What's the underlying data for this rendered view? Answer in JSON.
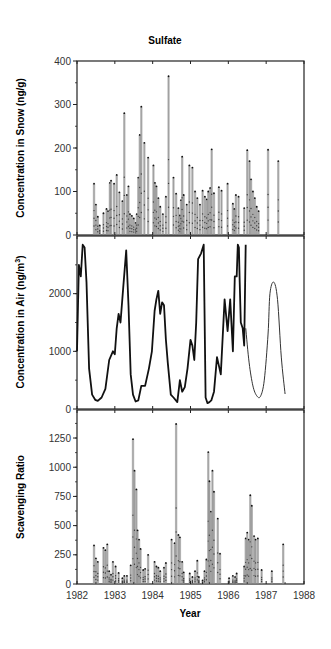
{
  "figure": {
    "title": "Sulfate",
    "xlabel": "Year",
    "x_ticks": [
      "1982",
      "1983",
      "1984",
      "1985",
      "1986",
      "1987",
      "1988"
    ],
    "colors": {
      "frame": "#222222",
      "bar": "#8a8a8a",
      "marker": "#111111",
      "line": "#111111",
      "model_line": "#333333"
    }
  },
  "chart_data": [
    {
      "type": "bar",
      "title": "Sulfate",
      "xlabel": "Year",
      "ylabel": "Concentration in Snow (ng/g)",
      "xlim": [
        1982,
        1988
      ],
      "ylim": [
        0,
        400
      ],
      "y_ticks": [
        0,
        100,
        200,
        300,
        400
      ],
      "grid": false,
      "note": "Event samples shown as thin vertical bars with point markers",
      "x": [
        1982.45,
        1982.5,
        1982.55,
        1982.6,
        1982.7,
        1982.78,
        1982.82,
        1982.87,
        1982.9,
        1982.98,
        1983.05,
        1983.12,
        1983.2,
        1983.25,
        1983.32,
        1983.36,
        1983.4,
        1983.45,
        1983.5,
        1983.55,
        1983.58,
        1983.62,
        1983.66,
        1983.7,
        1983.78,
        1983.88,
        1984.02,
        1984.06,
        1984.1,
        1984.15,
        1984.2,
        1984.27,
        1984.35,
        1984.42,
        1984.55,
        1984.62,
        1984.68,
        1984.72,
        1984.75,
        1984.78,
        1984.82,
        1984.9,
        1984.97,
        1985.05,
        1985.12,
        1985.18,
        1985.25,
        1985.32,
        1985.38,
        1985.43,
        1985.47,
        1985.52,
        1985.56,
        1985.62,
        1985.75,
        1985.82,
        1985.98,
        1986.12,
        1986.16,
        1986.2,
        1986.27,
        1986.42,
        1986.5,
        1986.56,
        1986.6,
        1986.65,
        1986.7,
        1986.75,
        1986.8,
        1987.05,
        1987.32
      ],
      "values": [
        118,
        70,
        42,
        22,
        50,
        60,
        55,
        120,
        125,
        118,
        138,
        98,
        78,
        280,
        92,
        112,
        48,
        44,
        38,
        28,
        48,
        132,
        230,
        295,
        212,
        178,
        160,
        120,
        112,
        85,
        65,
        48,
        88,
        365,
        132,
        95,
        62,
        45,
        80,
        180,
        92,
        70,
        160,
        155,
        100,
        85,
        70,
        102,
        88,
        82,
        100,
        108,
        197,
        96,
        110,
        102,
        118,
        72,
        60,
        92,
        88,
        62,
        195,
        170,
        128,
        100,
        85,
        65,
        55,
        196,
        170
      ]
    },
    {
      "type": "line",
      "ylabel": "Concentration in Air (ng/m3)",
      "xlim": [
        1982,
        1988
      ],
      "ylim": [
        0,
        3000
      ],
      "y_ticks": [
        0,
        1000,
        2000
      ],
      "grid": false,
      "series": [
        {
          "name": "Measured",
          "x": [
            1982.0,
            1982.05,
            1982.1,
            1982.15,
            1982.2,
            1982.25,
            1982.32,
            1982.4,
            1982.48,
            1982.55,
            1982.65,
            1982.75,
            1982.85,
            1982.95,
            1983.0,
            1983.05,
            1983.1,
            1983.15,
            1983.22,
            1983.3,
            1983.36,
            1983.42,
            1983.48,
            1983.55,
            1983.62,
            1983.7,
            1983.8,
            1983.9,
            1983.98,
            1984.05,
            1984.1,
            1984.15,
            1984.2,
            1984.25,
            1984.3,
            1984.35,
            1984.4,
            1984.48,
            1984.55,
            1984.65,
            1984.72,
            1984.78,
            1984.85,
            1984.92,
            1985.0,
            1985.05,
            1985.1,
            1985.15,
            1985.2,
            1985.28,
            1985.35,
            1985.4,
            1985.45,
            1985.5,
            1985.55,
            1985.62,
            1985.7,
            1985.8,
            1985.9,
            1985.98,
            1986.05,
            1986.12,
            1986.17,
            1986.22,
            1986.25,
            1986.28,
            1986.3,
            1986.33,
            1986.38,
            1986.42,
            1986.46
          ],
          "y": [
            1000,
            2500,
            2300,
            2850,
            2800,
            2200,
            700,
            250,
            160,
            140,
            200,
            350,
            850,
            1000,
            950,
            1400,
            1650,
            1500,
            2100,
            2750,
            1800,
            600,
            250,
            130,
            150,
            400,
            400,
            700,
            1000,
            1700,
            1900,
            2050,
            1650,
            1850,
            1800,
            1200,
            800,
            250,
            200,
            120,
            500,
            300,
            380,
            700,
            1200,
            1100,
            850,
            1500,
            2600,
            2700,
            2850,
            200,
            100,
            120,
            150,
            300,
            900,
            600,
            1900,
            1350,
            1900,
            1000,
            2300,
            2300,
            2850,
            2800,
            2200,
            1500,
            1400,
            1100,
            2850
          ]
        },
        {
          "name": "Model",
          "x": [
            1986.46,
            1986.55,
            1986.65,
            1986.75,
            1986.85,
            1986.95,
            1987.05,
            1987.1,
            1987.2,
            1987.3,
            1987.4,
            1987.5
          ],
          "y": [
            1400,
            800,
            400,
            230,
            220,
            500,
            1300,
            2000,
            2200,
            1900,
            900,
            260
          ]
        }
      ]
    },
    {
      "type": "bar",
      "ylabel": "Scavenging Ratio",
      "xlabel": "Year",
      "xlim": [
        1982,
        1988
      ],
      "ylim": [
        0,
        1490
      ],
      "y_ticks": [
        0,
        250,
        500,
        750,
        1000,
        1250
      ],
      "x_ticks": [
        1982,
        1983,
        1984,
        1985,
        1986,
        1987,
        1988
      ],
      "grid": false,
      "x": [
        1982.45,
        1982.5,
        1982.55,
        1982.7,
        1982.75,
        1982.8,
        1982.85,
        1982.9,
        1982.95,
        1983.02,
        1983.1,
        1983.2,
        1983.25,
        1983.32,
        1983.42,
        1983.48,
        1983.52,
        1983.57,
        1983.6,
        1983.64,
        1983.68,
        1983.75,
        1983.8,
        1983.88,
        1984.05,
        1984.1,
        1984.15,
        1984.2,
        1984.3,
        1984.35,
        1984.5,
        1984.58,
        1984.62,
        1984.68,
        1984.72,
        1984.78,
        1984.82,
        1984.98,
        1985.05,
        1985.12,
        1985.18,
        1985.22,
        1985.32,
        1985.37,
        1985.42,
        1985.47,
        1985.5,
        1985.54,
        1985.58,
        1985.62,
        1985.72,
        1985.78,
        1986.02,
        1986.12,
        1986.18,
        1986.22,
        1986.42,
        1986.46,
        1986.5,
        1986.54,
        1986.58,
        1986.62,
        1986.68,
        1986.72,
        1986.78,
        1986.88,
        1987.15,
        1987.45
      ],
      "values": [
        330,
        220,
        190,
        310,
        290,
        340,
        110,
        80,
        190,
        150,
        95,
        50,
        70,
        70,
        160,
        1240,
        970,
        810,
        460,
        380,
        300,
        120,
        130,
        250,
        190,
        150,
        140,
        110,
        140,
        180,
        380,
        350,
        1370,
        420,
        400,
        190,
        100,
        90,
        60,
        110,
        200,
        60,
        30,
        110,
        210,
        1130,
        880,
        620,
        970,
        790,
        560,
        260,
        50,
        70,
        60,
        90,
        150,
        390,
        440,
        380,
        760,
        670,
        410,
        380,
        390,
        120,
        110,
        340
      ]
    }
  ]
}
